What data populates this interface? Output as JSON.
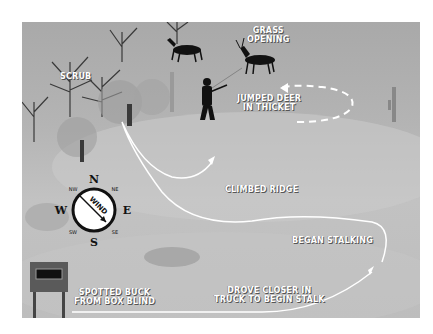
{
  "diagram": {
    "type": "illustrated hunting stalk route map",
    "labels": {
      "scrub": "SCRUB",
      "grass_opening_1": "GRASS",
      "grass_opening_2": "OPENING",
      "jumped_deer_1": "JUMPED DEER",
      "jumped_deer_2": "IN THICKET",
      "climbed_ridge": "CLIMBED RIDGE",
      "began_stalking": "BEGAN STALKING",
      "drove_closer_1": "DROVE CLOSER IN",
      "drove_closer_2": "TRUCK TO BEGIN STALK",
      "spotted_buck_1": "SPOTTED BUCK",
      "spotted_buck_2": "FROM BOX BLIND"
    },
    "compass": {
      "N": "N",
      "NE": "NE",
      "E": "E",
      "SE": "SE",
      "S": "S",
      "SW": "SW",
      "W": "W",
      "NW": "NW",
      "wind_label": "WIND",
      "wind_direction": "NW to SE"
    },
    "colors": {
      "background": "#b4b4b4",
      "route_line": "#ffffff",
      "silhouette": "#111111",
      "label_text": "#ffffff"
    }
  }
}
